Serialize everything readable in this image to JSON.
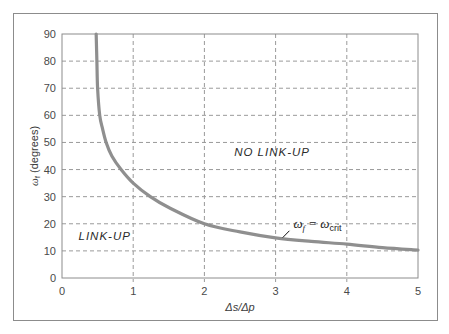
{
  "chart_data": {
    "type": "line",
    "title": "",
    "xlabel": "Δs/Δp",
    "ylabel": "ωf (degrees)",
    "ylabel_main": "ω",
    "ylabel_sub": "f",
    "ylabel_rest": " (degrees)",
    "xlim": [
      0,
      5
    ],
    "ylim": [
      0,
      90
    ],
    "xticks": [
      0,
      1,
      2,
      3,
      4,
      5
    ],
    "yticks": [
      0,
      10,
      20,
      30,
      40,
      50,
      60,
      70,
      80,
      90
    ],
    "grid": true,
    "grid_style": "dashed",
    "legend": null,
    "series": [
      {
        "name": "ωf = ωcrit",
        "color": "#8f8f8f",
        "x": [
          0.48,
          0.49,
          0.5,
          0.53,
          0.57,
          0.62,
          0.7,
          0.83,
          1.0,
          1.24,
          1.5,
          2.0,
          2.5,
          3.0,
          3.5,
          4.0,
          4.5,
          5.0
        ],
        "y": [
          90,
          80,
          70,
          60,
          55,
          50,
          45,
          40,
          35,
          30,
          26,
          20,
          17,
          14.8,
          13.5,
          12.5,
          11.2,
          10.3
        ]
      }
    ],
    "annotations": [
      {
        "text": "NO LINK-UP",
        "x": 2.95,
        "y": 45
      },
      {
        "text": "LINK-UP",
        "x": 0.6,
        "y": 14
      },
      {
        "text_main": "ω",
        "sub1": "f",
        "eq": " = ω",
        "sub2": "crit",
        "x": 3.25,
        "y": 20,
        "arrow_to": [
          3.1,
          14.9
        ]
      }
    ]
  }
}
